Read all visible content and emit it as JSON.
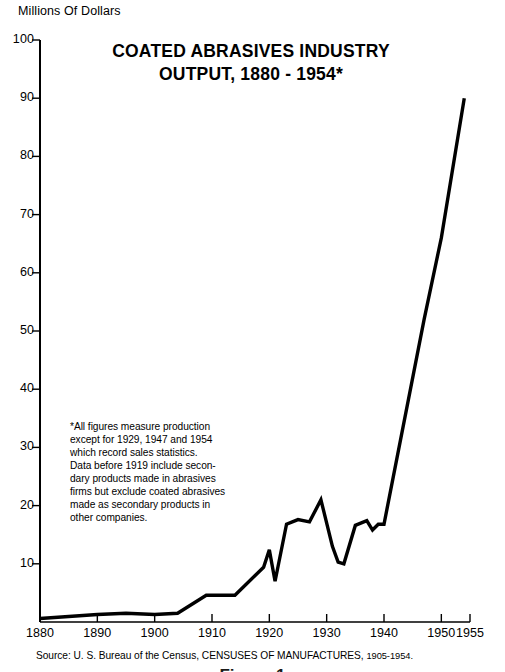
{
  "chart_data": {
    "type": "line",
    "title": "COATED ABRASIVES INDUSTRY",
    "title_line1": "COATED ABRASIVES INDUSTRY",
    "title_line2": "OUTPUT, 1880 - 1954*",
    "ylabel": "Millions Of Dollars",
    "xlabel": "",
    "xlim": [
      1880,
      1955
    ],
    "ylim": [
      0,
      100
    ],
    "yticks": [
      0,
      10,
      20,
      30,
      40,
      50,
      60,
      70,
      80,
      90,
      100
    ],
    "ytick_labels": [
      "",
      "10",
      "20",
      "30",
      "40",
      "50",
      "60",
      "70",
      "80",
      "90",
      "100"
    ],
    "xticks": [
      1880,
      1890,
      1900,
      1910,
      1920,
      1930,
      1940,
      1950,
      1955
    ],
    "xtick_labels": [
      "1880",
      "1890",
      "1900",
      "1910",
      "1920",
      "1930",
      "1940",
      "1950",
      "1955"
    ],
    "grid": false,
    "legend": false,
    "line_color": "#000000",
    "series": [
      {
        "name": "Coated abrasives output",
        "x": [
          1880,
          1890,
          1895,
          1900,
          1904,
          1909,
          1914,
          1919,
          1920,
          1921,
          1923,
          1925,
          1927,
          1929,
          1931,
          1932,
          1933,
          1935,
          1937,
          1938,
          1939,
          1940,
          1947,
          1950,
          1954
        ],
        "values": [
          0.6,
          1.3,
          1.5,
          1.3,
          1.5,
          4.6,
          4.6,
          9.4,
          12.4,
          7.0,
          16.8,
          17.6,
          17.2,
          21.0,
          13.0,
          10.3,
          10.0,
          16.6,
          17.4,
          15.8,
          16.8,
          16.8,
          52.0,
          66.0,
          90.0
        ]
      }
    ],
    "annotations": {
      "footnote": [
        "*All figures measure production",
        "except for 1929, 1947 and 1954",
        "which record sales statistics.",
        "Data before 1919 include secon-",
        "dary products made in abrasives",
        "firms but exclude coated abrasives",
        "made as secondary products in",
        "other companies."
      ],
      "source_prefix": "Source: U. S. Bureau of the Census,",
      "source_pub": "CENSUSES OF MANUFACTURES,",
      "source_years": "1905-1954.",
      "figure_label": "Figure 1"
    }
  }
}
